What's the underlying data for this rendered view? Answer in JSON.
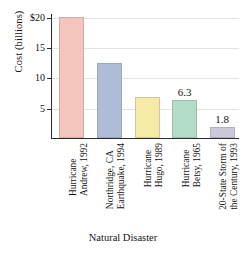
{
  "chart_data": {
    "type": "bar",
    "title": "",
    "xlabel": "Natural Disaster",
    "ylabel": "Cost (billions)",
    "categories": [
      "Hurricane Andrew, 1992",
      "Northridge, CA Earthquake, 1994",
      "Hurricane Hugo, 1989",
      "Hurricane Betsy, 1965",
      "20-State Storm of the Century, 1993"
    ],
    "category_lines": [
      [
        "Hurricane",
        "Andrew, 1992"
      ],
      [
        "Northridge, CA",
        "Earthquake, 1994"
      ],
      [
        "Hurricane",
        "Hugo, 1989"
      ],
      [
        "Hurricane",
        "Betsy, 1965"
      ],
      [
        "20-State Storm of",
        "the Century, 1993"
      ]
    ],
    "values": [
      20.0,
      12.3,
      6.8,
      6.3,
      1.8
    ],
    "point_labels": [
      "",
      "",
      "",
      "6.3",
      "1.8"
    ],
    "colors": [
      "#f3c5bc",
      "#aebcd8",
      "#f6eba6",
      "#b2dcc8",
      "#cdc7da"
    ],
    "ylim": [
      0,
      20.6
    ],
    "yticks": [
      5,
      10,
      15,
      20
    ],
    "ytick_labels": [
      "5",
      "10",
      "15",
      "$20"
    ],
    "grid": true,
    "legend": false
  }
}
